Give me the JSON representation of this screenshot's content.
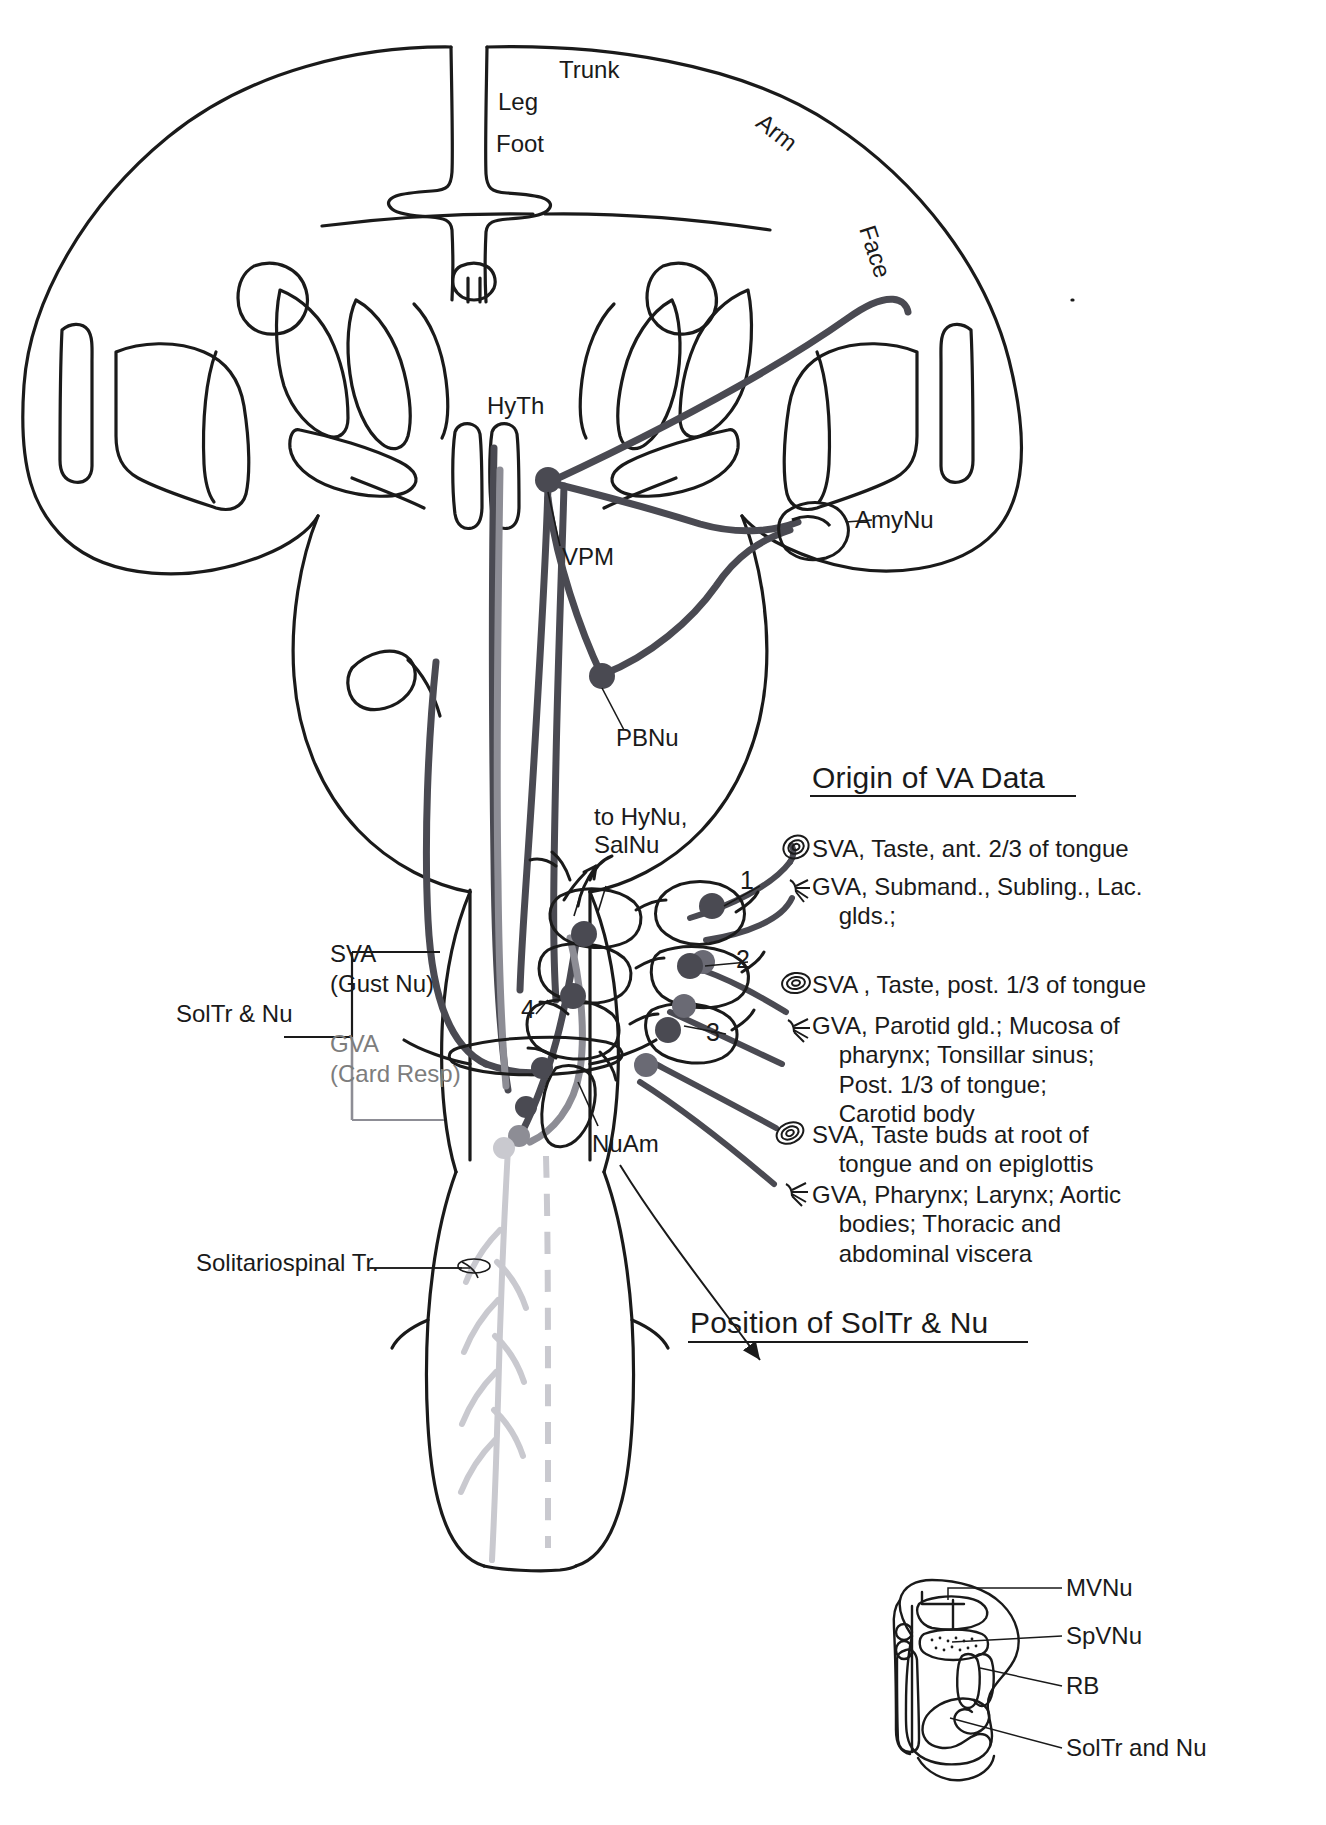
{
  "figure": {
    "type": "neuroanatomy-pathway-diagram",
    "colors": {
      "ink": "#1a1a1a",
      "pathway_dark": "#4a4a52",
      "pathway_gray": "#8d8d95",
      "pathway_light": "#c9c9cf",
      "background": "#ffffff"
    }
  },
  "cortex_labels": {
    "trunk": "Trunk",
    "leg": "Leg",
    "foot": "Foot",
    "arm": "Arm",
    "face": "Face"
  },
  "brain_labels": {
    "hyth": "HyTh",
    "vpm": "VPM",
    "amynu": "AmyNu",
    "pbnu": "PBNu",
    "to_hynu_salnu": "to HyNu,\nSalNu",
    "nuam": "NuAm"
  },
  "left_bracket": {
    "title": "SolTr & Nu",
    "rows": [
      {
        "main": "SVA",
        "sub": "(Gust Nu)",
        "gray": false
      },
      {
        "main": "GVA",
        "sub": "(Card Resp)",
        "gray": true
      }
    ],
    "solitariospinal": "Solitariospinal Tr."
  },
  "ganglion_numbers": [
    "1",
    "2",
    "3",
    "4"
  ],
  "legend": {
    "title": "Origin of VA Data",
    "entries": [
      {
        "icon": "taste-bud-icon",
        "modality": "SVA",
        "text": "SVA, Taste, ant. 2/3 of tongue"
      },
      {
        "icon": "free-nerve-ending-icon",
        "modality": "GVA",
        "text": "GVA, Submand., Subling., Lac.\n    glds.;"
      },
      {
        "icon": "taste-bud-icon",
        "modality": "SVA",
        "text": "SVA , Taste, post. 1/3 of tongue"
      },
      {
        "icon": "free-nerve-ending-icon",
        "modality": "GVA",
        "text": "GVA, Parotid gld.; Mucosa of\n    pharynx; Tonsillar sinus;\n    Post. 1/3 of tongue;\n    Carotid body"
      },
      {
        "icon": "taste-bud-icon",
        "modality": "SVA",
        "text": "SVA, Taste buds at root of\n    tongue and on epiglottis"
      },
      {
        "icon": "free-nerve-ending-icon",
        "modality": "GVA",
        "text": "GVA, Pharynx; Larynx; Aortic\n    bodies; Thoracic and\n    abdominal viscera"
      }
    ]
  },
  "inset": {
    "title": "Position of SolTr & Nu",
    "labels": [
      "MVNu",
      "SpVNu",
      "RB",
      "SolTr and Nu"
    ]
  }
}
